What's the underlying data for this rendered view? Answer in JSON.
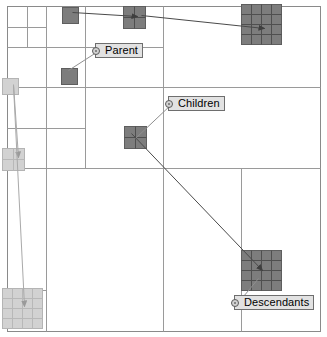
{
  "figure": {
    "background": "#ffffff",
    "width": 327,
    "height": 337
  },
  "palette": {
    "quadtree_line": "#9a9a9a",
    "outer_border": "#8a8a8a",
    "dark_block_fill": "#7d7d7d",
    "dark_block_stroke": "#5e5e5e",
    "dark_block_grid": "#4f4f4f",
    "light_block_fill": "#d2d2d2",
    "light_block_stroke": "#b4b4b4",
    "light_block_grid": "#b8b8b8",
    "arrow_dark": "#4a4a4a",
    "arrow_light": "#a9a9a9",
    "leader_line": "#8f8f8f",
    "callout_fill": "#e2e2e2",
    "callout_border": "#6e6e6e",
    "text": "#000000"
  },
  "callouts": [
    {
      "id": "parent",
      "name": "callout-parent",
      "label": "Parent",
      "x": 95,
      "y": 43,
      "anchor_x": 99,
      "anchor_y": 50,
      "leader_to_x": 68,
      "leader_to_y": 70
    },
    {
      "id": "children",
      "name": "callout-children",
      "label": "Children",
      "x": 168,
      "y": 96,
      "anchor_x": 172,
      "anchor_y": 103,
      "leader_to_x": 135,
      "leader_to_y": 138
    },
    {
      "id": "descendants",
      "name": "callout-descendants",
      "label": "Descendants",
      "x": 234,
      "y": 295,
      "anchor_x": 238,
      "anchor_y": 302,
      "leader_to_x": 258,
      "leader_to_y": 278
    }
  ],
  "blocks": [
    {
      "id": "parent-solid-top",
      "name": "block-parent-small-top",
      "x": 62,
      "y": 7,
      "w": 16,
      "h": 16,
      "cols": 1,
      "rows": 1,
      "tone": "dark"
    },
    {
      "id": "parent-solid-mid",
      "name": "block-parent-small",
      "x": 61,
      "y": 68,
      "w": 16,
      "h": 16,
      "cols": 1,
      "rows": 1,
      "tone": "dark"
    },
    {
      "id": "children-top",
      "name": "block-children-top",
      "x": 123,
      "y": 6,
      "w": 22,
      "h": 22,
      "cols": 2,
      "rows": 2,
      "tone": "dark"
    },
    {
      "id": "children-mid",
      "name": "block-children-center",
      "x": 124,
      "y": 126,
      "w": 22,
      "h": 22,
      "cols": 2,
      "rows": 2,
      "tone": "dark"
    },
    {
      "id": "descendants-top",
      "name": "block-descendants-top",
      "x": 241,
      "y": 4,
      "w": 40,
      "h": 40,
      "cols": 4,
      "rows": 4,
      "tone": "dark"
    },
    {
      "id": "descendants-bottom",
      "name": "block-descendants-bottom",
      "x": 241,
      "y": 250,
      "w": 40,
      "h": 40,
      "cols": 4,
      "rows": 4,
      "tone": "dark"
    },
    {
      "id": "light-small-left",
      "name": "block-light-small-left",
      "x": 2,
      "y": 78,
      "w": 16,
      "h": 16,
      "cols": 1,
      "rows": 1,
      "tone": "light"
    },
    {
      "id": "light-pair-left",
      "name": "block-light-pair-left",
      "x": 2,
      "y": 148,
      "w": 22,
      "h": 22,
      "cols": 2,
      "rows": 2,
      "tone": "light"
    },
    {
      "id": "light-grid-bottom",
      "name": "block-light-grid-bottom",
      "x": 2,
      "y": 288,
      "w": 40,
      "h": 40,
      "cols": 4,
      "rows": 4,
      "tone": "light"
    }
  ],
  "arrows": [
    {
      "id": "arrow-parent-to-children",
      "name": "arrow-parent-to-children",
      "tone": "dark",
      "from_x": 72,
      "from_y": 12,
      "to_x": 137,
      "to_y": 16
    },
    {
      "id": "arrow-children-to-descendants",
      "name": "arrow-children-to-descendants",
      "tone": "dark",
      "from_x": 141,
      "from_y": 15,
      "to_x": 264,
      "to_y": 28
    },
    {
      "id": "arrow-children-center-to-descendants",
      "name": "arrow-children-center-to-descendants",
      "tone": "dark",
      "from_x": 131,
      "from_y": 133,
      "to_x": 262,
      "to_y": 270
    },
    {
      "id": "arrow-light-left-down",
      "name": "arrow-light-left-down",
      "tone": "light",
      "from_x": 13,
      "from_y": 84,
      "to_x": 18,
      "to_y": 157
    },
    {
      "id": "arrow-light-left-bottom",
      "name": "arrow-light-left-bottom",
      "tone": "light",
      "from_x": 13,
      "from_y": 85,
      "to_x": 24,
      "to_y": 306
    }
  ],
  "quadtree": {
    "outer": {
      "x": 7,
      "y": 6,
      "w": 313,
      "h": 325
    },
    "lines": [
      {
        "name": "split-root-vertical",
        "x1": 163,
        "y1": 6,
        "x2": 163,
        "y2": 331
      },
      {
        "name": "split-root-horizontal",
        "x1": 7,
        "y1": 168,
        "x2": 320,
        "y2": 168
      },
      {
        "name": "split-nw-vertical",
        "x1": 85,
        "y1": 6,
        "x2": 85,
        "y2": 168
      },
      {
        "name": "split-nw-horizontal",
        "x1": 7,
        "y1": 87,
        "x2": 163,
        "y2": 87
      },
      {
        "name": "split-nw-nw-vertical",
        "x1": 46,
        "y1": 6,
        "x2": 46,
        "y2": 87
      },
      {
        "name": "split-nw-nw-horizontal",
        "x1": 7,
        "y1": 47,
        "x2": 85,
        "y2": 47
      },
      {
        "name": "split-nw-ne-horizontal",
        "x1": 85,
        "y1": 47,
        "x2": 163,
        "y2": 47
      },
      {
        "name": "split-nw-sw-vertical",
        "x1": 46,
        "y1": 87,
        "x2": 46,
        "y2": 168
      },
      {
        "name": "split-nw-sw-horizontal",
        "x1": 7,
        "y1": 128,
        "x2": 85,
        "y2": 128
      },
      {
        "name": "split-nw-nw-nw-vertical",
        "x1": 27,
        "y1": 6,
        "x2": 27,
        "y2": 47
      },
      {
        "name": "split-nw-nw-nw-horizontal",
        "x1": 7,
        "y1": 27,
        "x2": 46,
        "y2": 27
      },
      {
        "name": "split-ne-horizontal",
        "x1": 163,
        "y1": 87,
        "x2": 320,
        "y2": 87
      },
      {
        "name": "split-sw-vertical",
        "x1": 46,
        "y1": 168,
        "x2": 46,
        "y2": 331
      },
      {
        "name": "split-sw-horizontal",
        "x1": 7,
        "y1": 290,
        "x2": 46,
        "y2": 290
      },
      {
        "name": "split-se-vertical",
        "x1": 241,
        "y1": 168,
        "x2": 241,
        "y2": 331
      }
    ]
  }
}
